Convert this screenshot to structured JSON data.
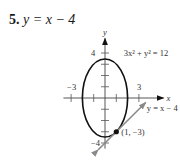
{
  "problem": {
    "number": "5.",
    "equation": "y = x − 4"
  },
  "chart_data": {
    "type": "line",
    "title": "",
    "xlabel": "x",
    "ylabel": "y",
    "xlim": [
      -3.5,
      5
    ],
    "ylim": [
      -4.5,
      5.3
    ],
    "x_ticks": [
      -3,
      -2,
      -1,
      1,
      2,
      3
    ],
    "y_ticks": [
      -4,
      -3,
      -2,
      -1,
      1,
      2,
      3,
      4
    ],
    "x_tick_labels": [
      {
        "value": -3,
        "text": "−3"
      },
      {
        "value": 3,
        "text": "3"
      }
    ],
    "y_tick_labels": [
      {
        "value": 4,
        "text": "4"
      },
      {
        "value": -4,
        "text": "−4"
      }
    ],
    "series": [
      {
        "name": "3x² + y² = 12",
        "kind": "ellipse",
        "a": 2,
        "b": 3.4641,
        "center": [
          0,
          0
        ],
        "color": "#111111"
      },
      {
        "name": "y = x − 4",
        "kind": "line",
        "slope": 1,
        "intercept": -4,
        "x_range": [
          -0.6,
          3.6
        ],
        "color": "#8a8a8a"
      }
    ],
    "points": [
      {
        "x": 1,
        "y": -3,
        "label": "(1, −3)"
      }
    ],
    "annotations": [
      {
        "text": "3x² + y² = 12",
        "anchor": [
          2.2,
          4
        ]
      },
      {
        "text": "y = x − 4",
        "anchor": [
          3.7,
          -0.9
        ]
      }
    ]
  }
}
